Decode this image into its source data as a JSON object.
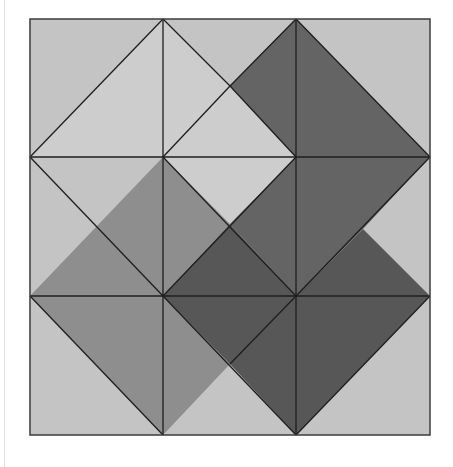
{
  "figure": {
    "grid": {
      "x_lines": [
        30,
        163,
        296,
        430
      ],
      "y_lines": [
        19,
        157,
        296,
        435
      ]
    },
    "colors": {
      "background": "#c4c4c4",
      "light": "#cdcdcd",
      "medium": "#8e8e8e",
      "dark": "#646464",
      "darkest": "#575757",
      "stroke": "#1e1e1e"
    },
    "shapes": [
      {
        "name": "light-arrow-shape",
        "fill": "light",
        "points": "163,19 230,86 296,157 230,224 163,157 30,157"
      },
      {
        "name": "dark-top-right-shape",
        "fill": "dark",
        "points": "296,19 430,157 363,229 296,296 230,224 296,157 230,86"
      },
      {
        "name": "medium-left-shape",
        "fill": "medium",
        "points": "163,157 230,224 163,296 230,364 163,435 30,296"
      },
      {
        "name": "darkest-bottom-right-shape",
        "fill": "darkest",
        "points": "230,224 296,296 363,229 430,296 296,435 230,364 163,296"
      }
    ],
    "lines": [
      [
        163,
        19,
        30,
        157
      ],
      [
        163,
        19,
        230,
        86
      ],
      [
        230,
        86,
        296,
        19
      ],
      [
        296,
        19,
        430,
        157
      ],
      [
        30,
        157,
        163,
        296
      ],
      [
        163,
        157,
        296,
        296
      ],
      [
        296,
        157,
        163,
        296
      ],
      [
        430,
        157,
        296,
        296
      ],
      [
        30,
        296,
        163,
        435
      ],
      [
        163,
        296,
        296,
        435
      ],
      [
        296,
        435,
        430,
        296
      ],
      [
        230,
        364,
        296,
        296
      ],
      [
        163,
        157,
        230,
        86
      ],
      [
        230,
        86,
        296,
        157
      ]
    ]
  }
}
